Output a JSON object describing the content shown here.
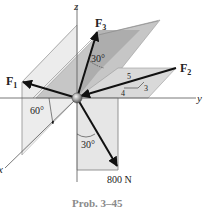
{
  "figure": {
    "caption": "Prob. 3–45",
    "axes": {
      "x": "x",
      "y": "y",
      "z": "z"
    },
    "forces": {
      "F1": {
        "label": "F",
        "sub": "1"
      },
      "F2": {
        "label": "F",
        "sub": "2"
      },
      "F3": {
        "label": "F",
        "sub": "3"
      },
      "F4": {
        "label": "800 N"
      }
    },
    "angles": {
      "f1_angle": "60°",
      "f3_angle": "30°",
      "f4_angle": "30°"
    },
    "slope_triangle": {
      "hyp": "5",
      "adj": "4",
      "opp": "3"
    },
    "colors": {
      "plane_light": "#e4e4e4",
      "plane_mid": "#cfcfcf",
      "plane_dark": "#a9a9a9",
      "arrow": "#111111",
      "axis": "#555555"
    }
  }
}
